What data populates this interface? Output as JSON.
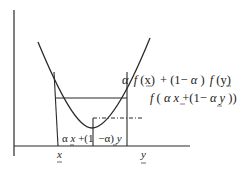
{
  "diagram": {
    "colors": {
      "stroke": "#2a2a2a",
      "background": "#ffffff"
    },
    "labels": {
      "chord_value": "α f(x) + (1−α) f(y)",
      "chord_value_parts": {
        "alpha": "α",
        "f1": "f",
        "x_arg": "(x)",
        "plus": "+ (1−",
        "alpha2": "α",
        "paren": ")",
        "f2": "f",
        "y_arg": "(y)"
      },
      "function_value": "f(αx+(1−αy))",
      "function_value_parts": {
        "f": "f",
        "open": "(",
        "alpha": "α",
        "x": "x",
        "rest": "+(1−",
        "alpha2": "α",
        "y": "y",
        "close": "))"
      },
      "midpoint": "αx+(1−α)y",
      "midpoint_parts": {
        "alpha": "α",
        "x": "x",
        "plus": "+(1",
        "minus_alpha": "−α)",
        "y": "y"
      },
      "x_tick": "x",
      "y_tick": "y"
    }
  }
}
